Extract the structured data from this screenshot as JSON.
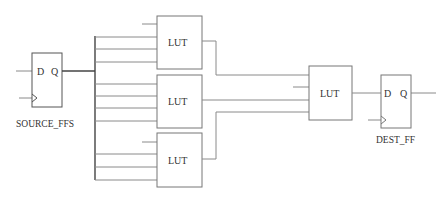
{
  "diagram": {
    "type": "logic-circuit",
    "source_ff": {
      "label": "SOURCE_FFS",
      "pin_d": "D",
      "pin_q": "Q"
    },
    "luts": [
      {
        "label": "LUT"
      },
      {
        "label": "LUT"
      },
      {
        "label": "LUT"
      }
    ],
    "final_lut": {
      "label": "LUT"
    },
    "dest_ff": {
      "label": "DEST_FF",
      "pin_d": "D",
      "pin_q": "Q"
    },
    "colors": {
      "stroke_dark": "#444444",
      "stroke_light": "#8a8a8a",
      "text": "#333333"
    }
  }
}
